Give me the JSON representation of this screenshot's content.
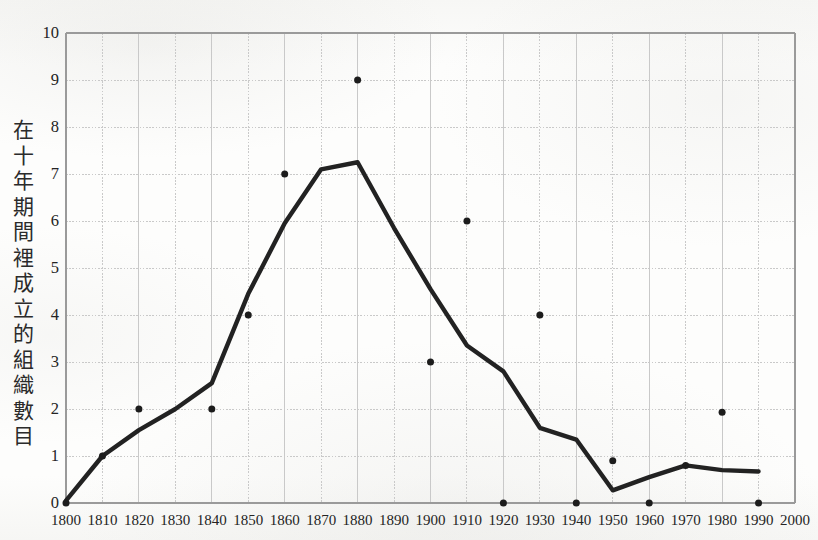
{
  "chart_data": {
    "type": "line",
    "title": "",
    "xlabel": "",
    "ylabel": "在十年期間裡成立的組織數目",
    "xlim": [
      1800,
      2000
    ],
    "ylim": [
      0,
      10
    ],
    "grid": true,
    "legend": "none",
    "x_ticks": [
      "1800",
      "1810",
      "1820",
      "1830",
      "1840",
      "1850",
      "1860",
      "1870",
      "1880",
      "1890",
      "1900",
      "1910",
      "1920",
      "1930",
      "1940",
      "1950",
      "1960",
      "1970",
      "1980",
      "1990",
      "2000"
    ],
    "y_ticks": [
      "0",
      "1",
      "2",
      "3",
      "4",
      "5",
      "6",
      "7",
      "8",
      "9",
      "10"
    ],
    "series": [
      {
        "name": "觀測數據點",
        "render": "scatter",
        "marker": "filled-circle",
        "color": "#1c1c1c",
        "x": [
          1800,
          1810,
          1820,
          1840,
          1850,
          1860,
          1880,
          1900,
          1910,
          1920,
          1930,
          1940,
          1950,
          1960,
          1970,
          1980,
          1990
        ],
        "values": [
          0,
          1,
          2,
          2,
          4,
          7,
          9,
          3,
          6,
          0,
          4,
          0,
          0.9,
          0,
          0.8,
          1.93,
          0
        ]
      },
      {
        "name": "平滑趨勢線",
        "render": "line",
        "color": "#222222",
        "x": [
          1800,
          1810,
          1820,
          1830,
          1840,
          1850,
          1860,
          1870,
          1880,
          1890,
          1900,
          1910,
          1920,
          1930,
          1940,
          1950,
          1960,
          1970,
          1980,
          1990
        ],
        "values": [
          0.05,
          1.0,
          1.55,
          2.0,
          2.55,
          4.45,
          5.95,
          7.1,
          7.25,
          5.85,
          4.55,
          3.35,
          2.8,
          1.6,
          1.35,
          0.27,
          0.55,
          0.8,
          0.7,
          0.67
        ]
      }
    ]
  },
  "axes": {
    "y_title_chars": [
      "在",
      "十",
      "年",
      "期",
      "間",
      "裡",
      "成",
      "立",
      "的",
      "組",
      "織",
      "數",
      "目"
    ]
  },
  "top_caption": ""
}
